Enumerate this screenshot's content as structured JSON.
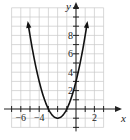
{
  "chart_data": {
    "type": "line",
    "title": "",
    "xlabel": "x",
    "ylabel": "y",
    "xlim": [
      -7,
      3
    ],
    "ylim": [
      -2,
      11
    ],
    "grid": true,
    "x_tick_labels": [
      "-6",
      "-4",
      "2"
    ],
    "y_tick_labels": [
      "2",
      "4",
      "6",
      "8"
    ],
    "series": [
      {
        "name": "y = (x+2)^2 - 1",
        "equation": "y = (x + 2)^2 - 1",
        "x": [
          -5.2,
          -5,
          -4,
          -3,
          -2,
          -1,
          0,
          1,
          1.2
        ],
        "y": [
          9.24,
          8,
          3,
          0,
          -1,
          0,
          3,
          8,
          9.24
        ],
        "arrows_at_ends": true,
        "color": "#111111"
      }
    ],
    "vertex": [
      -2,
      -1
    ]
  },
  "colors": {
    "grid": "#c8c8c8",
    "axis": "#222222",
    "curve": "#111111",
    "text": "#222222"
  }
}
